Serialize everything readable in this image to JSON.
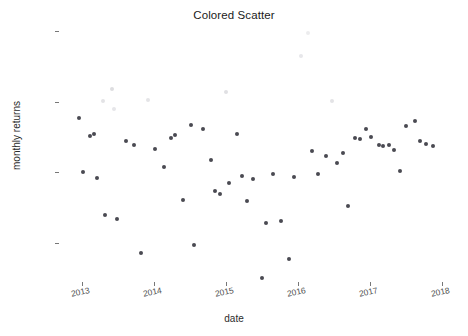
{
  "chart_data": {
    "type": "scatter",
    "title": "Colored Scatter",
    "xlabel": "date",
    "ylabel": "monthly returns",
    "grid": false,
    "legend": "none",
    "xlim": [
      "2012-11",
      "2018-02"
    ],
    "ylim": [
      -0.062,
      0.085
    ],
    "x_ticks": [
      "2013",
      "2014",
      "2015",
      "2016",
      "2017",
      "2018"
    ],
    "y_ticks": [
      "0.08",
      "0.04",
      "0.00",
      "-0.04"
    ],
    "y_tick_values": [
      0.08,
      0.04,
      0.0,
      -0.04
    ],
    "color_scale": {
      "description": "points shaded by return magnitude: high returns rendered very light gray, typical returns dark gray",
      "low_color": "#4a4a52",
      "high_color": "#ececee"
    },
    "points": [
      {
        "x": 2012.96,
        "y": 0.0309,
        "c": "#4a4a52"
      },
      {
        "x": 2013.02,
        "y": 0.0,
        "c": "#4a4a52"
      },
      {
        "x": 2013.12,
        "y": 0.0203,
        "c": "#4a4a52"
      },
      {
        "x": 2013.17,
        "y": 0.0215,
        "c": "#4a4a52"
      },
      {
        "x": 2013.21,
        "y": -0.003,
        "c": "#4a4a52"
      },
      {
        "x": 2013.3,
        "y": 0.0405,
        "c": "#e3e3e6"
      },
      {
        "x": 2013.33,
        "y": -0.024,
        "c": "#4a4a52"
      },
      {
        "x": 2013.42,
        "y": 0.047,
        "c": "#dddde0"
      },
      {
        "x": 2013.45,
        "y": 0.036,
        "c": "#e6e6e9"
      },
      {
        "x": 2013.49,
        "y": -0.0262,
        "c": "#4a4a52"
      },
      {
        "x": 2013.62,
        "y": 0.018,
        "c": "#4a4a52"
      },
      {
        "x": 2013.73,
        "y": 0.0152,
        "c": "#4a4a52"
      },
      {
        "x": 2013.83,
        "y": -0.0455,
        "c": "#4a4a52"
      },
      {
        "x": 2013.92,
        "y": 0.041,
        "c": "#e4e4e7"
      },
      {
        "x": 2014.02,
        "y": 0.013,
        "c": "#4a4a52"
      },
      {
        "x": 2014.14,
        "y": 0.003,
        "c": "#4a4a52"
      },
      {
        "x": 2014.24,
        "y": 0.0195,
        "c": "#4a4a52"
      },
      {
        "x": 2014.3,
        "y": 0.021,
        "c": "#4a4a52"
      },
      {
        "x": 2014.41,
        "y": -0.0155,
        "c": "#4a4a52"
      },
      {
        "x": 2014.52,
        "y": 0.0265,
        "c": "#4a4a52"
      },
      {
        "x": 2014.56,
        "y": -0.041,
        "c": "#4a4a52"
      },
      {
        "x": 2014.68,
        "y": 0.0245,
        "c": "#4a4a52"
      },
      {
        "x": 2014.79,
        "y": 0.0072,
        "c": "#4a4a52"
      },
      {
        "x": 2014.85,
        "y": -0.0105,
        "c": "#4a4a52"
      },
      {
        "x": 2014.92,
        "y": -0.0122,
        "c": "#4a4a52"
      },
      {
        "x": 2015.0,
        "y": 0.0452,
        "c": "#e0e0e3"
      },
      {
        "x": 2015.05,
        "y": -0.0058,
        "c": "#4a4a52"
      },
      {
        "x": 2015.16,
        "y": 0.0215,
        "c": "#4a4a52"
      },
      {
        "x": 2015.22,
        "y": -0.0022,
        "c": "#4a4a52"
      },
      {
        "x": 2015.3,
        "y": -0.016,
        "c": "#4a4a52"
      },
      {
        "x": 2015.38,
        "y": -0.004,
        "c": "#4a4a52"
      },
      {
        "x": 2015.5,
        "y": -0.06,
        "c": "#4a4a52"
      },
      {
        "x": 2015.56,
        "y": -0.0285,
        "c": "#4a4a52"
      },
      {
        "x": 2015.66,
        "y": -0.0007,
        "c": "#4a4a52"
      },
      {
        "x": 2015.76,
        "y": -0.0275,
        "c": "#4a4a52"
      },
      {
        "x": 2015.88,
        "y": -0.049,
        "c": "#4a4a52"
      },
      {
        "x": 2015.95,
        "y": -0.0025,
        "c": "#4a4a52"
      },
      {
        "x": 2016.04,
        "y": 0.066,
        "c": "#e7e7ea"
      },
      {
        "x": 2016.14,
        "y": 0.0785,
        "c": "#ececee"
      },
      {
        "x": 2016.2,
        "y": 0.012,
        "c": "#4a4a52"
      },
      {
        "x": 2016.28,
        "y": -0.001,
        "c": "#4a4a52"
      },
      {
        "x": 2016.39,
        "y": 0.009,
        "c": "#4a4a52"
      },
      {
        "x": 2016.48,
        "y": 0.0405,
        "c": "#e3e3e6"
      },
      {
        "x": 2016.54,
        "y": 0.0055,
        "c": "#4a4a52"
      },
      {
        "x": 2016.63,
        "y": 0.0108,
        "c": "#4a4a52"
      },
      {
        "x": 2016.7,
        "y": -0.019,
        "c": "#4a4a52"
      },
      {
        "x": 2016.8,
        "y": 0.0192,
        "c": "#4a4a52"
      },
      {
        "x": 2016.86,
        "y": 0.019,
        "c": "#4a4a52"
      },
      {
        "x": 2016.95,
        "y": 0.0245,
        "c": "#4a4a52"
      },
      {
        "x": 2017.02,
        "y": 0.0198,
        "c": "#4a4a52"
      },
      {
        "x": 2017.12,
        "y": 0.0152,
        "c": "#4a4a52"
      },
      {
        "x": 2017.18,
        "y": 0.015,
        "c": "#4a4a52"
      },
      {
        "x": 2017.26,
        "y": 0.0152,
        "c": "#4a4a52"
      },
      {
        "x": 2017.33,
        "y": 0.0128,
        "c": "#4a4a52"
      },
      {
        "x": 2017.42,
        "y": 0.001,
        "c": "#4a4a52"
      },
      {
        "x": 2017.5,
        "y": 0.0262,
        "c": "#4a4a52"
      },
      {
        "x": 2017.62,
        "y": 0.0288,
        "c": "#4a4a52"
      },
      {
        "x": 2017.7,
        "y": 0.0178,
        "c": "#4a4a52"
      },
      {
        "x": 2017.78,
        "y": 0.016,
        "c": "#4a4a52"
      },
      {
        "x": 2017.87,
        "y": 0.0148,
        "c": "#4a4a52"
      }
    ]
  },
  "axes": {
    "y_title": "monthly returns",
    "x_title": "date"
  },
  "title": "Colored Scatter"
}
